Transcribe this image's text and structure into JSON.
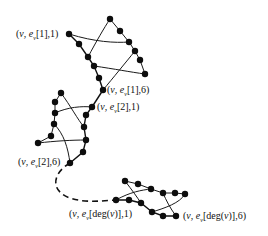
{
  "diagram": {
    "colors": {
      "ink": "#111111",
      "background": "#ffffff"
    },
    "labels": {
      "top_start": "(v, e_v[1],1)",
      "top_end": "(v, e_v[1],6)",
      "mid_start": "(v, e_v[2],1)",
      "mid_end": "(v, e_v[2],6)",
      "bottom_start": "(v, e_v[deg(v)],1)",
      "bottom_end": "(v, e_v[deg(v)],6)"
    },
    "label_parts": {
      "top_start": {
        "pre": "(",
        "v": "v",
        "sep": ", ",
        "e": "e",
        "sub": "v",
        "idx": "[1],1)"
      },
      "top_end": {
        "pre": "(",
        "v": "v",
        "sep": ", ",
        "e": "e",
        "sub": "v",
        "idx": "[1],6)"
      },
      "mid_start": {
        "pre": "(",
        "v": "v",
        "sep": ", ",
        "e": "e",
        "sub": "v",
        "idx": "[2],1)"
      },
      "mid_end": {
        "pre": "(",
        "v": "v",
        "sep": ", ",
        "e": "e",
        "sub": "v",
        "idx": "[2],6)"
      },
      "bottom_start": {
        "pre": "(",
        "v": "v",
        "sep": ", ",
        "e": "e",
        "sub": "v",
        "idx1": "[deg(",
        "iv": "v",
        "idx2": ")],1)"
      },
      "bottom_end": {
        "pre": "(",
        "v": "v",
        "sep": ", ",
        "e": "e",
        "sub": "v",
        "idx1": "[deg(",
        "iv": "v",
        "idx2": ")],6)"
      }
    },
    "gadgets": [
      {
        "name": "gadget-e1",
        "nodes_per_side": 6
      },
      {
        "name": "gadget-e2",
        "nodes_per_side": 6
      },
      {
        "name": "gadget-edeg",
        "nodes_per_side": 6
      }
    ],
    "connector": {
      "style": "dashed",
      "meaning": "intermediate gadgets omitted"
    }
  }
}
